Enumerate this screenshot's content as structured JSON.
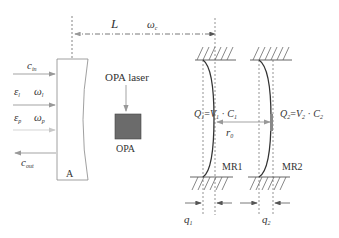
{
  "diagram": {
    "distance": {
      "label": "L",
      "frequency_symbol": "ω",
      "frequency_sub": "c"
    },
    "inputs": [
      {
        "symbol": "c",
        "sub": "in",
        "direction": "in"
      },
      {
        "symbol": "ε",
        "sub": "l",
        "freq": "ω",
        "freq_sub": "l",
        "direction": "in"
      },
      {
        "symbol": "ε",
        "sub": "p",
        "freq": "ω",
        "freq_sub": "p",
        "direction": "in"
      },
      {
        "symbol": "c",
        "sub": "out",
        "direction": "out"
      }
    ],
    "mirror_a": {
      "label": "A"
    },
    "opa": {
      "laser_label": "OPA laser",
      "box_label": "OPA"
    },
    "mr1": {
      "label": "MR1",
      "charge_eq": {
        "Q": "Q",
        "Q_sub": "1",
        "V": "V",
        "V_sub": "1",
        "C": "C",
        "C_sub": "1"
      },
      "displacement": {
        "symbol": "q",
        "sub": "1"
      }
    },
    "mr2": {
      "label": "MR2",
      "charge_eq": {
        "Q": "Q",
        "Q_sub": "2",
        "V": "V",
        "V_sub": "2",
        "C": "C",
        "C_sub": "2"
      },
      "displacement": {
        "symbol": "q",
        "sub": "2"
      }
    },
    "separation": {
      "symbol": "r",
      "sub": "0"
    },
    "colors": {
      "line": "#555555",
      "arrow_light": "#aaaaaa",
      "opa_box": "#6b6b6b",
      "text": "#333333"
    }
  }
}
